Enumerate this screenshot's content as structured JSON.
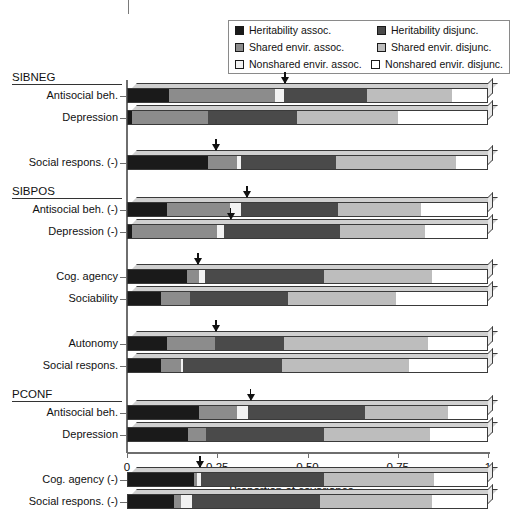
{
  "chart_data": {
    "type": "bar",
    "orientation": "horizontal",
    "stacked": true,
    "title": "",
    "xlabel": "Proportion of covariance",
    "ylabel": "",
    "xlim": [
      0,
      1
    ],
    "xticks": [
      0,
      0.25,
      0.5,
      0.75,
      1
    ],
    "xticklabels": [
      "0",
      "0.25",
      "0.50",
      "0.75",
      "1"
    ],
    "grid": false,
    "legend_position": "top-right",
    "legend": [
      {
        "label": "Heritability assoc.",
        "color": "#1a1a1a"
      },
      {
        "label": "Heritability disjunc.",
        "color": "#4a4a4a"
      },
      {
        "label": "Shared envir. assoc.",
        "color": "#8c8c8c"
      },
      {
        "label": "Shared envir. disjunc.",
        "color": "#bdbdbd"
      },
      {
        "label": "Nonshared envir. assoc.",
        "color": "#f2f2f2"
      },
      {
        "label": "Nonshared envir. disjunc.",
        "color": "#ffffff"
      }
    ],
    "series": [
      {
        "name": "Heritability assoc.",
        "color": "#1a1a1a"
      },
      {
        "name": "Shared envir. assoc.",
        "color": "#8c8c8c"
      },
      {
        "name": "Nonshared envir. assoc.",
        "color": "#f2f2f2"
      },
      {
        "name": "Heritability disjunc.",
        "color": "#4a4a4a"
      },
      {
        "name": "Shared envir. disjunc.",
        "color": "#bdbdbd"
      },
      {
        "name": "Nonshared envir. disjunc.",
        "color": "#ffffff"
      }
    ],
    "groups": [
      {
        "name": "SIBNEG",
        "bars": [
          {
            "label": "Antisocial beh.",
            "values": [
              0.115,
              0.295,
              0.025,
              0.23,
              0.235,
              0.1
            ],
            "arrow_at": 0.435
          },
          {
            "label": "Depression",
            "values": [
              0.015,
              0.21,
              0.0,
              0.245,
              0.28,
              0.25
            ],
            "arrow_at": null
          },
          {
            "label": "Social respons. (-)",
            "values": [
              0.225,
              0.08,
              0.01,
              0.265,
              0.33,
              0.09
            ],
            "arrow_at": 0.245
          }
        ]
      },
      {
        "name": "SIBPOS",
        "bars": [
          {
            "label": "Antisocial beh. (-)",
            "values": [
              0.11,
              0.175,
              0.03,
              0.27,
              0.23,
              0.185
            ],
            "arrow_at": 0.33
          },
          {
            "label": "Depression (-)",
            "values": [
              0.015,
              0.235,
              0.02,
              0.32,
              0.235,
              0.175
            ],
            "arrow_at": 0.285
          },
          {
            "label": "Cog. agency",
            "values": [
              0.165,
              0.035,
              0.015,
              0.33,
              0.3,
              0.155
            ],
            "arrow_at": 0.195
          },
          {
            "label": "Sociability",
            "values": [
              0.095,
              0.08,
              0.0,
              0.27,
              0.3,
              0.255
            ],
            "arrow_at": null
          },
          {
            "label": "Autonomy",
            "values": [
              0.11,
              0.135,
              0.0,
              0.19,
              0.4,
              0.165
            ],
            "arrow_at": 0.245
          },
          {
            "label": "Social respons.",
            "values": [
              0.095,
              0.055,
              0.005,
              0.275,
              0.35,
              0.22
            ],
            "arrow_at": null
          }
        ]
      },
      {
        "name": "PCONF",
        "bars": [
          {
            "label": "Antisocial beh.",
            "values": [
              0.2,
              0.105,
              0.03,
              0.325,
              0.23,
              0.11
            ],
            "arrow_at": 0.34
          },
          {
            "label": "Depression",
            "values": [
              0.17,
              0.05,
              0.0,
              0.325,
              0.295,
              0.16
            ],
            "arrow_at": null
          },
          {
            "label": "Cog. agency (-)",
            "values": [
              0.185,
              0.01,
              0.01,
              0.34,
              0.305,
              0.15
            ],
            "arrow_at": 0.2
          },
          {
            "label": "Social respons. (-)",
            "values": [
              0.13,
              0.02,
              0.03,
              0.355,
              0.31,
              0.155
            ],
            "arrow_at": null
          }
        ]
      }
    ]
  }
}
